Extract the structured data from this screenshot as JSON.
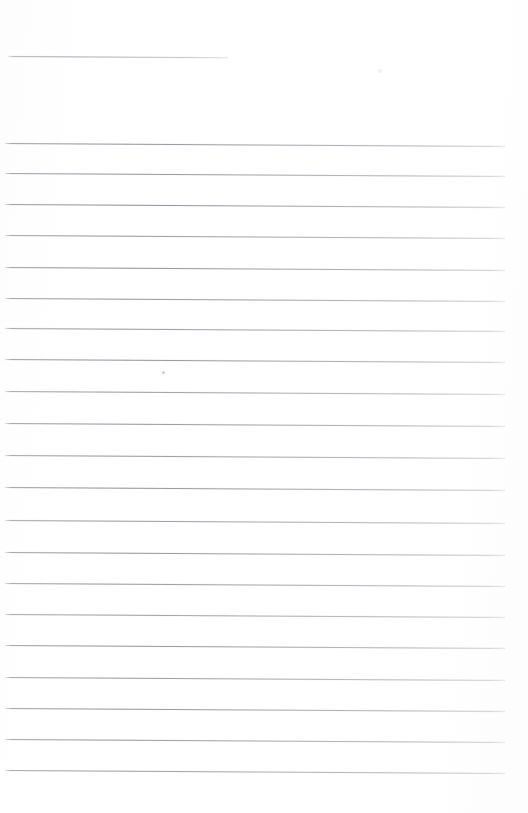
{
  "document": {
    "type": "scanned-ruled-page",
    "title": "Blank Ruled Notebook Page",
    "description": "Scanned blank lined writing page with no handwriting or printed text",
    "page_width": 528,
    "page_height": 813,
    "background_color": "#ffffff",
    "rule_color": "#8a8a94",
    "rule_thickness_px": 1,
    "rule_spacing_px": 31.2,
    "rule_count": 22,
    "skew_degrees": 0.33,
    "written_text": "",
    "has_handwriting": false,
    "has_printed_text": false,
    "margin_left_px": 6,
    "margin_right_px": 23
  },
  "rules": [
    {
      "index": 1,
      "y": 55.5,
      "x_start": 8,
      "x_end": 228,
      "opacity": 0.72,
      "note": "short top rule"
    },
    {
      "index": 2,
      "y": 142.5,
      "x_start": 5,
      "x_end": 505,
      "opacity": 0.92
    },
    {
      "index": 3,
      "y": 173.0,
      "x_start": 5,
      "x_end": 505,
      "opacity": 0.9
    },
    {
      "index": 4,
      "y": 203.5,
      "x_start": 5,
      "x_end": 505,
      "opacity": 0.95
    },
    {
      "index": 5,
      "y": 234.5,
      "x_start": 5,
      "x_end": 505,
      "opacity": 0.88
    },
    {
      "index": 6,
      "y": 266.5,
      "x_start": 5,
      "x_end": 505,
      "opacity": 0.93
    },
    {
      "index": 7,
      "y": 297.5,
      "x_start": 5,
      "x_end": 505,
      "opacity": 0.9
    },
    {
      "index": 8,
      "y": 328.0,
      "x_start": 5,
      "x_end": 505,
      "opacity": 0.88
    },
    {
      "index": 9,
      "y": 359.0,
      "x_start": 5,
      "x_end": 505,
      "opacity": 0.92
    },
    {
      "index": 10,
      "y": 390.5,
      "x_start": 5,
      "x_end": 505,
      "opacity": 0.86
    },
    {
      "index": 11,
      "y": 423.0,
      "x_start": 5,
      "x_end": 505,
      "opacity": 0.9
    },
    {
      "index": 12,
      "y": 454.5,
      "x_start": 5,
      "x_end": 505,
      "opacity": 0.88
    },
    {
      "index": 13,
      "y": 486.5,
      "x_start": 5,
      "x_end": 505,
      "opacity": 0.93
    },
    {
      "index": 14,
      "y": 519.5,
      "x_start": 5,
      "x_end": 505,
      "opacity": 0.86
    },
    {
      "index": 15,
      "y": 551.5,
      "x_start": 5,
      "x_end": 505,
      "opacity": 0.9
    },
    {
      "index": 16,
      "y": 583.0,
      "x_start": 5,
      "x_end": 505,
      "opacity": 0.88
    },
    {
      "index": 17,
      "y": 614.0,
      "x_start": 5,
      "x_end": 505,
      "opacity": 0.84
    },
    {
      "index": 18,
      "y": 645.0,
      "x_start": 5,
      "x_end": 505,
      "opacity": 0.9
    },
    {
      "index": 19,
      "y": 676.5,
      "x_start": 5,
      "x_end": 505,
      "opacity": 0.86
    },
    {
      "index": 20,
      "y": 707.5,
      "x_start": 5,
      "x_end": 505,
      "opacity": 0.9
    },
    {
      "index": 21,
      "y": 738.5,
      "x_start": 5,
      "x_end": 505,
      "opacity": 0.88
    },
    {
      "index": 22,
      "y": 769.5,
      "x_start": 5,
      "x_end": 505,
      "opacity": 0.84
    }
  ],
  "artifacts": [
    {
      "name": "scan-speck-center",
      "x": 162,
      "y": 371,
      "size": 3,
      "tone": "mid"
    },
    {
      "name": "scan-speck-top-right",
      "x": 378,
      "y": 69,
      "size": 4,
      "tone": "faint"
    }
  ]
}
